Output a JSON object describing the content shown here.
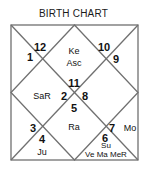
{
  "title": "BIRTH CHART",
  "houses": [
    {
      "number": "12",
      "planets": ""
    },
    {
      "number": "11",
      "planets": "Ke\nAsc"
    },
    {
      "number": "10",
      "planets": ""
    },
    {
      "number": "1",
      "planets": ""
    },
    {
      "number": "9",
      "planets": ""
    },
    {
      "number": "2",
      "planets": "SaR"
    },
    {
      "number": "8",
      "planets": ""
    },
    {
      "number": "5",
      "planets": "Ra"
    },
    {
      "number": "3",
      "planets": ""
    },
    {
      "number": "7",
      "planets": "Mo"
    },
    {
      "number": "4",
      "planets": "Ju"
    },
    {
      "number": "6",
      "planets": "Su\nVe Ma MeR"
    }
  ],
  "labels": {
    "n12": "12",
    "n1": "1",
    "n10": "10",
    "n9": "9",
    "n11": "11",
    "n2": "2",
    "n8": "8",
    "n5": "5",
    "n3": "3",
    "n4": "4",
    "n7": "7",
    "n6": "6",
    "ke": "Ke",
    "asc": "Asc",
    "sar": "SaR",
    "ra": "Ra",
    "mo": "Mo",
    "ju": "Ju",
    "su": "Su",
    "ve_ma_mer": "Ve Ma MeR"
  },
  "colors": {
    "line": "#707070",
    "text": "#111111"
  }
}
